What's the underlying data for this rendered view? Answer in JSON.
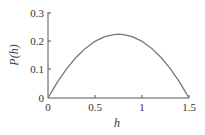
{
  "chart_data": {
    "type": "line",
    "title": "",
    "xlabel": "h",
    "ylabel": "P(h)",
    "xlim": [
      0,
      1.5
    ],
    "ylim": [
      0,
      0.3
    ],
    "xticks": [
      "0",
      "0.5",
      "1",
      "1.5"
    ],
    "yticks": [
      "0",
      "0.1",
      "0.2",
      "0.3"
    ],
    "grid": false,
    "legend": null,
    "series": [
      {
        "name": "P(h)",
        "color": "#777777",
        "x": [
          0,
          0.1,
          0.2,
          0.3,
          0.4,
          0.5,
          0.6,
          0.7,
          0.75,
          0.8,
          0.9,
          1.0,
          1.1,
          1.2,
          1.3,
          1.4,
          1.5
        ],
        "y": [
          0,
          0.056,
          0.104,
          0.144,
          0.176,
          0.2,
          0.216,
          0.224,
          0.225,
          0.224,
          0.216,
          0.2,
          0.176,
          0.144,
          0.104,
          0.056,
          0
        ]
      }
    ]
  },
  "labels": {
    "x_axis": "h",
    "y_axis": "P(h)",
    "xtick_0": "0",
    "xtick_1": "0.5",
    "xtick_2": "1",
    "xtick_3": "1.5",
    "ytick_0": "0",
    "ytick_1": "0.1",
    "ytick_2": "0.2",
    "ytick_3": "0.3"
  }
}
